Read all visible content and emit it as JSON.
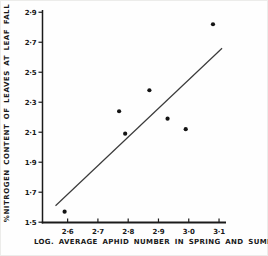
{
  "chart_data": {
    "type": "scatter",
    "title": "",
    "xlabel": "LOG. AVERAGE APHID NUMBER IN SPRING AND SUMMER",
    "ylabel": "%NITROGEN CONTENT OF LEAVES AT LEAF FALL",
    "xlim": [
      2.517,
      3.123
    ],
    "ylim": [
      1.498,
      2.915
    ],
    "grid": false,
    "x_ticks": {
      "values": [
        2.6,
        2.7,
        2.8,
        2.9,
        3.0,
        3.1
      ],
      "labels": [
        "2·6",
        "2·7",
        "2·8",
        "2·9",
        "3·0",
        "3·1"
      ]
    },
    "y_ticks": {
      "values": [
        1.5,
        1.7,
        1.9,
        2.1,
        2.3,
        2.5,
        2.7,
        2.9
      ],
      "labels": [
        "1·5",
        "1·7",
        "1·9",
        "2·1",
        "2·3",
        "2·5",
        "2·7",
        "2·9"
      ]
    },
    "points": [
      {
        "x": 2.59,
        "y": 1.57
      },
      {
        "x": 2.77,
        "y": 2.24
      },
      {
        "x": 2.79,
        "y": 2.09
      },
      {
        "x": 2.87,
        "y": 2.38
      },
      {
        "x": 2.93,
        "y": 2.19
      },
      {
        "x": 2.99,
        "y": 2.12
      },
      {
        "x": 3.08,
        "y": 2.82
      }
    ],
    "trendline": {
      "x1": 2.56,
      "y1": 1.61,
      "x2": 3.11,
      "y2": 2.66
    },
    "axis_color": "#1a1a1a",
    "point_color": "#141414",
    "line_color": "#3a3a3a",
    "tick_label_color": "#191919"
  }
}
